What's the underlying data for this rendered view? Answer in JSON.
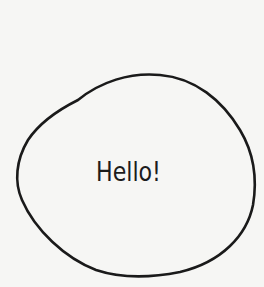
{
  "drawing": {
    "shape": "hand-drawn-blob",
    "stroke_color": "#1a1a1a",
    "fill_color": "#f6f6f4",
    "background_color": "#f6f6f4"
  },
  "bubble": {
    "text": "Hello!"
  }
}
